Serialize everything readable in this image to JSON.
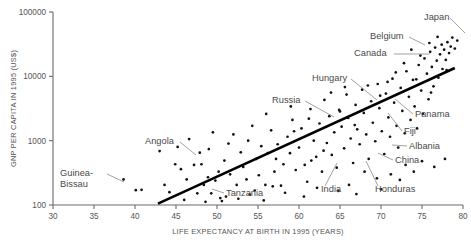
{
  "chart_data": {
    "type": "scatter",
    "title": "",
    "xlabel": "LIFE EXPECTANCY AT BIRTH IN 1995 (YEARS)",
    "ylabel": "GNP PER CAPITA IN 1995 (US$)",
    "xlim": [
      30,
      80
    ],
    "ylim": [
      100,
      100000
    ],
    "yscale": "log",
    "xticks": [
      30,
      35,
      40,
      45,
      50,
      55,
      60,
      65,
      70,
      75,
      80
    ],
    "xtick_labels": [
      "30",
      "35",
      "40",
      "45",
      "50",
      "55",
      "60",
      "65",
      "70",
      "75",
      "80"
    ],
    "yticks": [
      100,
      1000,
      10000,
      100000
    ],
    "ytick_labels": [
      "100",
      "1000",
      "10000",
      "100000"
    ],
    "grid": false,
    "legend": false,
    "trendline": {
      "x0": 42.8,
      "y0": 105,
      "x1": 79.0,
      "y1": 13500
    },
    "annotations": [
      {
        "label": "Japan",
        "label_x": 424,
        "label_y": 20,
        "lx1": 450,
        "ly1": 18,
        "lx2": 465,
        "ly2": 33
      },
      {
        "label": "Belgium",
        "label_x": 370,
        "label_y": 39,
        "lx1": 409,
        "ly1": 37,
        "lx2": 425,
        "ly2": 45
      },
      {
        "label": "Canada",
        "label_x": 354,
        "label_y": 56,
        "lx1": 394,
        "ly1": 54,
        "lx2": 430,
        "ly2": 54
      },
      {
        "label": "Hungary",
        "label_x": 312,
        "label_y": 81,
        "lx1": 351,
        "ly1": 79,
        "lx2": 377,
        "ly2": 100
      },
      {
        "label": "Russia",
        "label_x": 272,
        "label_y": 103,
        "lx1": 305,
        "ly1": 101,
        "lx2": 334,
        "ly2": 117
      },
      {
        "label": "Panama",
        "label_x": 415,
        "label_y": 117,
        "lx1": 413,
        "ly1": 114,
        "lx2": 395,
        "ly2": 99
      },
      {
        "label": "Fiji",
        "label_x": 404,
        "label_y": 134,
        "lx1": 402,
        "ly1": 131,
        "lx2": 388,
        "ly2": 113
      },
      {
        "label": "Albania",
        "label_x": 409,
        "label_y": 149,
        "lx1": 407,
        "ly1": 146,
        "lx2": 392,
        "ly2": 145
      },
      {
        "label": "China",
        "label_x": 395,
        "label_y": 163,
        "lx1": 393,
        "ly1": 160,
        "lx2": 378,
        "ly2": 153
      },
      {
        "label": "Angola",
        "label_x": 145,
        "label_y": 144,
        "lx1": 180,
        "ly1": 142,
        "lx2": 196,
        "ly2": 155
      },
      {
        "label": "Guinea-Bissau",
        "label_x": 60,
        "label_y": 176,
        "lx1": 107,
        "ly1": 174,
        "lx2": 124,
        "ly2": 182
      },
      {
        "label": "Tanzania",
        "label_x": 226,
        "label_y": 196,
        "lx1": 224,
        "ly1": 193,
        "lx2": 212,
        "ly2": 189
      },
      {
        "label": "India",
        "label_x": 321,
        "label_y": 192,
        "lx1": 325,
        "ly1": 186,
        "lx2": 337,
        "ly2": 163
      },
      {
        "label": "Honduras",
        "label_x": 375,
        "label_y": 192,
        "lx1": 378,
        "ly1": 186,
        "lx2": 366,
        "ly2": 161
      }
    ],
    "points": [
      {
        "x": 38.6,
        "y": 250
      },
      {
        "x": 40.1,
        "y": 170
      },
      {
        "x": 40.8,
        "y": 172
      },
      {
        "x": 43.0,
        "y": 690
      },
      {
        "x": 43.6,
        "y": 205
      },
      {
        "x": 44.2,
        "y": 158
      },
      {
        "x": 44.9,
        "y": 430
      },
      {
        "x": 45.6,
        "y": 360
      },
      {
        "x": 46.3,
        "y": 250
      },
      {
        "x": 46.6,
        "y": 1060
      },
      {
        "x": 47.2,
        "y": 420
      },
      {
        "x": 47.6,
        "y": 152
      },
      {
        "x": 48.1,
        "y": 430
      },
      {
        "x": 48.4,
        "y": 205
      },
      {
        "x": 48.9,
        "y": 270
      },
      {
        "x": 49.0,
        "y": 740
      },
      {
        "x": 49.3,
        "y": 152
      },
      {
        "x": 49.8,
        "y": 240
      },
      {
        "x": 50.2,
        "y": 330
      },
      {
        "x": 50.4,
        "y": 128
      },
      {
        "x": 50.9,
        "y": 490
      },
      {
        "x": 51.1,
        "y": 135
      },
      {
        "x": 51.6,
        "y": 300
      },
      {
        "x": 52.0,
        "y": 1250
      },
      {
        "x": 52.4,
        "y": 205
      },
      {
        "x": 52.9,
        "y": 660
      },
      {
        "x": 53.2,
        "y": 390
      },
      {
        "x": 53.6,
        "y": 250
      },
      {
        "x": 54.0,
        "y": 145
      },
      {
        "x": 54.3,
        "y": 1700
      },
      {
        "x": 54.8,
        "y": 520
      },
      {
        "x": 55.1,
        "y": 290
      },
      {
        "x": 55.4,
        "y": 820
      },
      {
        "x": 55.9,
        "y": 205
      },
      {
        "x": 56.2,
        "y": 640
      },
      {
        "x": 56.6,
        "y": 1450
      },
      {
        "x": 57.0,
        "y": 330
      },
      {
        "x": 57.4,
        "y": 880
      },
      {
        "x": 57.8,
        "y": 200
      },
      {
        "x": 58.1,
        "y": 430
      },
      {
        "x": 58.6,
        "y": 1150
      },
      {
        "x": 58.9,
        "y": 640
      },
      {
        "x": 59.2,
        "y": 2100
      },
      {
        "x": 59.6,
        "y": 350
      },
      {
        "x": 60.0,
        "y": 780
      },
      {
        "x": 60.3,
        "y": 1550
      },
      {
        "x": 60.7,
        "y": 420
      },
      {
        "x": 61.0,
        "y": 230
      },
      {
        "x": 61.4,
        "y": 3100
      },
      {
        "x": 61.8,
        "y": 1000
      },
      {
        "x": 62.1,
        "y": 560
      },
      {
        "x": 62.5,
        "y": 1850
      },
      {
        "x": 62.8,
        "y": 330
      },
      {
        "x": 63.1,
        "y": 4300
      },
      {
        "x": 63.4,
        "y": 920
      },
      {
        "x": 63.7,
        "y": 2400
      },
      {
        "x": 64.0,
        "y": 600
      },
      {
        "x": 64.3,
        "y": 1350
      },
      {
        "x": 64.6,
        "y": 380
      },
      {
        "x": 64.9,
        "y": 3000
      },
      {
        "x": 65.2,
        "y": 1650
      },
      {
        "x": 65.5,
        "y": 760
      },
      {
        "x": 65.8,
        "y": 5200
      },
      {
        "x": 66.0,
        "y": 2250
      },
      {
        "x": 66.3,
        "y": 1080
      },
      {
        "x": 66.6,
        "y": 450
      },
      {
        "x": 66.9,
        "y": 3600
      },
      {
        "x": 67.1,
        "y": 1500
      },
      {
        "x": 67.4,
        "y": 880
      },
      {
        "x": 67.7,
        "y": 6200
      },
      {
        "x": 67.9,
        "y": 2700
      },
      {
        "x": 68.2,
        "y": 1250
      },
      {
        "x": 68.5,
        "y": 520
      },
      {
        "x": 68.8,
        "y": 4100
      },
      {
        "x": 69.0,
        "y": 1900
      },
      {
        "x": 69.3,
        "y": 980
      },
      {
        "x": 69.6,
        "y": 7600
      },
      {
        "x": 69.8,
        "y": 3200
      },
      {
        "x": 70.1,
        "y": 1400
      },
      {
        "x": 70.4,
        "y": 620
      },
      {
        "x": 70.6,
        "y": 5400
      },
      {
        "x": 70.9,
        "y": 2300
      },
      {
        "x": 71.1,
        "y": 1150
      },
      {
        "x": 71.4,
        "y": 9200
      },
      {
        "x": 71.6,
        "y": 3900
      },
      {
        "x": 71.9,
        "y": 1700
      },
      {
        "x": 72.1,
        "y": 780
      },
      {
        "x": 72.4,
        "y": 6600
      },
      {
        "x": 72.6,
        "y": 2900
      },
      {
        "x": 72.9,
        "y": 1300
      },
      {
        "x": 73.1,
        "y": 12000
      },
      {
        "x": 73.4,
        "y": 4800
      },
      {
        "x": 73.6,
        "y": 2100
      },
      {
        "x": 73.9,
        "y": 8800
      },
      {
        "x": 74.1,
        "y": 3400
      },
      {
        "x": 74.4,
        "y": 1550
      },
      {
        "x": 74.6,
        "y": 15000
      },
      {
        "x": 74.9,
        "y": 6000
      },
      {
        "x": 75.1,
        "y": 2600
      },
      {
        "x": 75.3,
        "y": 19000
      },
      {
        "x": 75.6,
        "y": 11000
      },
      {
        "x": 75.8,
        "y": 4400
      },
      {
        "x": 76.0,
        "y": 24000
      },
      {
        "x": 76.2,
        "y": 14000
      },
      {
        "x": 76.4,
        "y": 7000
      },
      {
        "x": 76.6,
        "y": 28000
      },
      {
        "x": 76.8,
        "y": 17500
      },
      {
        "x": 77.0,
        "y": 9500
      },
      {
        "x": 77.2,
        "y": 22000
      },
      {
        "x": 77.4,
        "y": 31000
      },
      {
        "x": 77.5,
        "y": 13000
      },
      {
        "x": 77.7,
        "y": 26000
      },
      {
        "x": 77.9,
        "y": 18000
      },
      {
        "x": 78.1,
        "y": 34000
      },
      {
        "x": 78.3,
        "y": 23000
      },
      {
        "x": 78.5,
        "y": 29000
      },
      {
        "x": 78.7,
        "y": 40000
      },
      {
        "x": 79.0,
        "y": 27000
      },
      {
        "x": 79.3,
        "y": 36000
      },
      {
        "x": 76.9,
        "y": 41000
      },
      {
        "x": 75.9,
        "y": 33000
      },
      {
        "x": 74.8,
        "y": 21000
      },
      {
        "x": 73.7,
        "y": 26000
      },
      {
        "x": 78.0,
        "y": 12500
      },
      {
        "x": 76.1,
        "y": 5600
      },
      {
        "x": 74.3,
        "y": 9000
      },
      {
        "x": 72.8,
        "y": 16000
      },
      {
        "x": 71.8,
        "y": 11500
      },
      {
        "x": 70.8,
        "y": 8200
      },
      {
        "x": 69.9,
        "y": 5000
      },
      {
        "x": 68.4,
        "y": 7200
      },
      {
        "x": 66.8,
        "y": 1750
      },
      {
        "x": 65.0,
        "y": 2850
      },
      {
        "x": 63.0,
        "y": 700
      },
      {
        "x": 61.5,
        "y": 490
      },
      {
        "x": 59.4,
        "y": 1400
      },
      {
        "x": 57.2,
        "y": 520
      },
      {
        "x": 56.0,
        "y": 2600
      },
      {
        "x": 53.8,
        "y": 1000
      },
      {
        "x": 51.4,
        "y": 900
      },
      {
        "x": 49.5,
        "y": 1350
      },
      {
        "x": 47.9,
        "y": 650
      },
      {
        "x": 45.2,
        "y": 800
      },
      {
        "x": 58.3,
        "y": 155
      },
      {
        "x": 62.2,
        "y": 185
      },
      {
        "x": 64.8,
        "y": 165
      },
      {
        "x": 66.1,
        "y": 205
      },
      {
        "x": 67.0,
        "y": 148
      },
      {
        "x": 60.6,
        "y": 135
      },
      {
        "x": 55.7,
        "y": 118
      },
      {
        "x": 68.0,
        "y": 330
      },
      {
        "x": 69.5,
        "y": 260
      },
      {
        "x": 71.2,
        "y": 300
      },
      {
        "x": 72.3,
        "y": 245
      },
      {
        "x": 70.0,
        "y": 175
      },
      {
        "x": 73.0,
        "y": 420
      },
      {
        "x": 74.0,
        "y": 330
      },
      {
        "x": 75.0,
        "y": 480
      },
      {
        "x": 76.5,
        "y": 390
      },
      {
        "x": 77.8,
        "y": 520
      },
      {
        "x": 65.6,
        "y": 6800
      },
      {
        "x": 63.9,
        "y": 5600
      },
      {
        "x": 61.2,
        "y": 2200
      },
      {
        "x": 59.0,
        "y": 3400
      },
      {
        "x": 56.8,
        "y": 195
      },
      {
        "x": 54.6,
        "y": 168
      },
      {
        "x": 52.6,
        "y": 125
      },
      {
        "x": 50.6,
        "y": 115
      },
      {
        "x": 48.6,
        "y": 112
      },
      {
        "x": 46.0,
        "y": 120
      }
    ]
  }
}
